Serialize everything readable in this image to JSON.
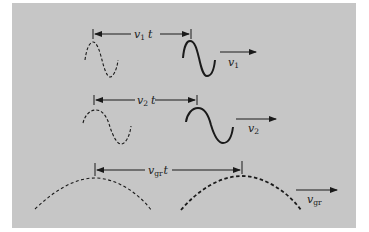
{
  "figure": {
    "background_color": "#c6c6c6",
    "ink_color": "#1a1a1a",
    "rows": [
      {
        "id": "wave-1",
        "distance_label": {
          "symbol": "v",
          "subscript": "1",
          "suffix": "t"
        },
        "velocity_label": {
          "symbol": "v",
          "subscript": "1"
        },
        "initial_wave": "dashed sine (one period)",
        "final_wave": "solid sine (one period)"
      },
      {
        "id": "wave-2",
        "distance_label": {
          "symbol": "v",
          "subscript": "2",
          "suffix": "t"
        },
        "velocity_label": {
          "symbol": "v",
          "subscript": "2"
        },
        "initial_wave": "dashed sine (one longer period)",
        "final_wave": "solid sine (one longer period)"
      },
      {
        "id": "group",
        "distance_label": {
          "symbol": "v",
          "subscript": "gr",
          "suffix": "t"
        },
        "velocity_label": {
          "symbol": "v",
          "subscript": "gr"
        },
        "initial_wave": "dashed envelope arc",
        "final_wave": "bold dashed envelope arc"
      }
    ]
  }
}
